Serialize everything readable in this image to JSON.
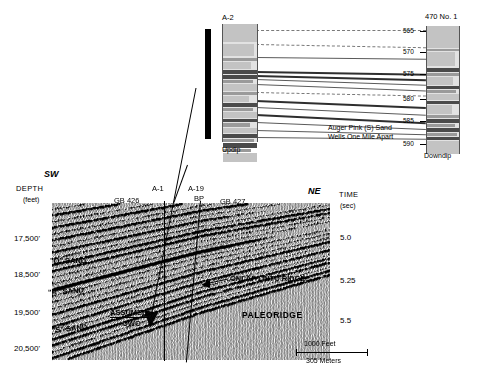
{
  "figure": {
    "type": "seismic-section-with-well-correlation-inset"
  },
  "well_panel": {
    "left_well_label": "A-2",
    "right_well_label": "470 No. 1",
    "left_direction_label": "Updip",
    "right_direction_label": "Downdip",
    "caption_line1": "Auger Pink (S) Sand",
    "caption_line2": "Wells One Mile Apart",
    "depth_ticks": [
      "565",
      "570",
      "575",
      "580",
      "585",
      "590"
    ]
  },
  "seismic": {
    "azimuth_left": "SW",
    "azimuth_right": "NE",
    "depth_axis_title": "DEPTH",
    "depth_axis_units": "(feet)",
    "time_axis_title": "TIME",
    "time_axis_units": "(sec)",
    "depth_ticks": [
      "17,500'",
      "18,500'",
      "19,500'",
      "20,500'"
    ],
    "time_ticks": [
      "5.0",
      "5.25",
      "5.5"
    ],
    "well_labels": [
      {
        "name": "A-1"
      },
      {
        "name": "A-19",
        "operator": "BP"
      }
    ],
    "block_labels": [
      "GB  426",
      "GB  427"
    ],
    "horizon_labels": [
      "\"Q\" SAND",
      "\"R\" SAND",
      "\"S\" SAND"
    ],
    "annotations": [
      "ASSUMED",
      "OWC",
      "ONLAP ONTO RIDGE",
      "PALEORIDGE"
    ],
    "scale_feet": "1000  Feet",
    "scale_meters": "305 Meters"
  },
  "colors": {
    "ink": "#000000",
    "well_fill": "#e2e2e2",
    "bed_dark": "#4a4a4a",
    "bed_mid": "#9a9a9a",
    "correlation_line": "#5a5a5a"
  }
}
